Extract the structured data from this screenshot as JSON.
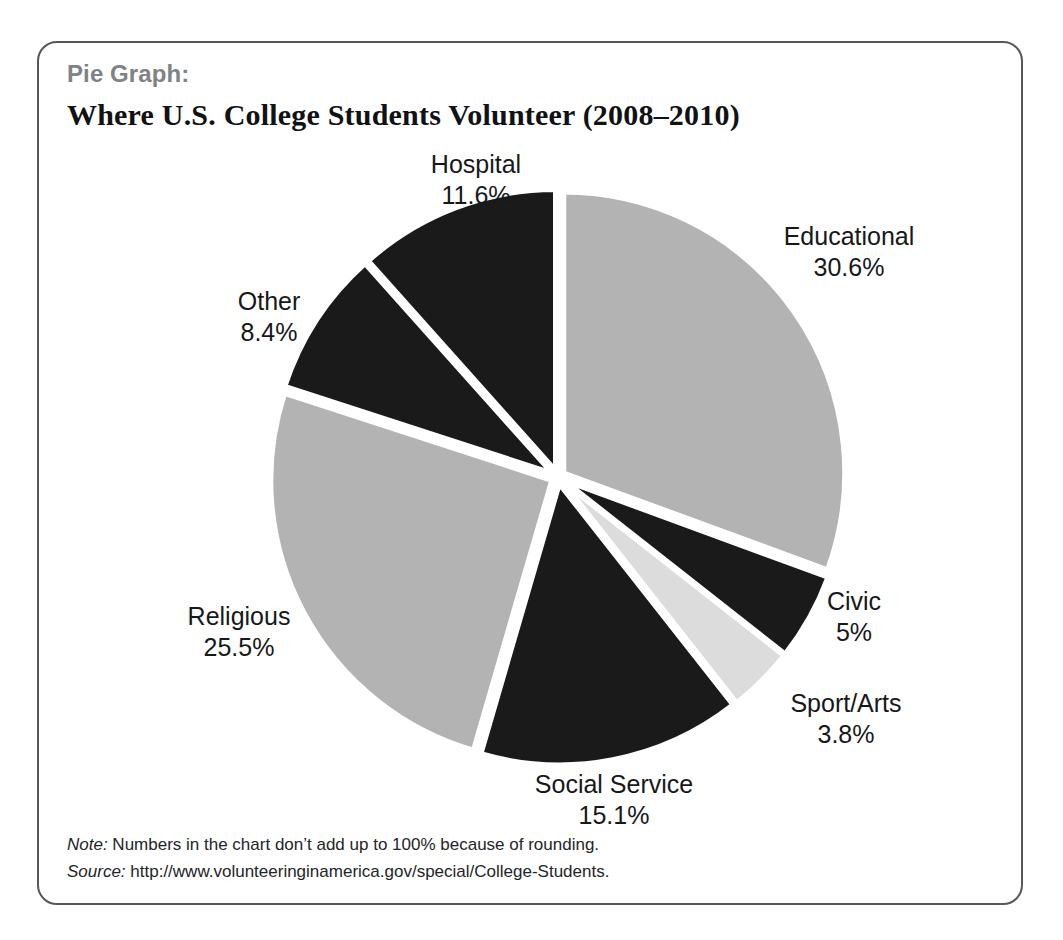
{
  "header": {
    "kicker": "Pie Graph:",
    "title": "Where U.S. College Students Volunteer (2008–2010)"
  },
  "footnotes": {
    "note_tag": "Note:",
    "note_text": " Numbers in the chart don’t add up to 100% because of rounding.",
    "source_tag": "Source:",
    "source_text": " http://www.volunteeringinamerica.gov/special/College-Students."
  },
  "labels": {
    "hospital": {
      "name": "Hospital",
      "value": "11.6%"
    },
    "educational": {
      "name": "Educational",
      "value": "30.6%"
    },
    "civic": {
      "name": "Civic",
      "value": "5%"
    },
    "sport_arts": {
      "name": "Sport/Arts",
      "value": "3.8%"
    },
    "social_service": {
      "name": "Social Service",
      "value": "15.1%"
    },
    "religious": {
      "name": "Religious",
      "value": "25.5%"
    },
    "other": {
      "name": "Other",
      "value": "8.4%"
    }
  },
  "colors": {
    "light_gray": "#b3b3b3",
    "pale_gray": "#dcdcdc",
    "near_black": "#1a1a1a",
    "gap_white": "#ffffff",
    "card_border": "#55585c",
    "kicker_gray": "#808286",
    "text_black": "#17181a"
  },
  "chart_data": {
    "type": "pie",
    "title": "Where U.S. College Students Volunteer (2008–2010)",
    "subtitle": "Pie Graph:",
    "unit": "percent",
    "start_angle_deg": 0,
    "direction": "clockwise",
    "exploded": true,
    "legend": "none (labels placed outside slices)",
    "categories": [
      "Educational",
      "Civic",
      "Sport/Arts",
      "Social Service",
      "Religious",
      "Other",
      "Hospital"
    ],
    "values": [
      30.6,
      5.0,
      3.8,
      15.1,
      25.5,
      8.4,
      11.6
    ],
    "slice_colors": [
      "#b3b3b3",
      "#1a1a1a",
      "#dcdcdc",
      "#1a1a1a",
      "#b3b3b3",
      "#1a1a1a",
      "#1a1a1a"
    ],
    "labels_formatted": [
      "30.6%",
      "5%",
      "3.8%",
      "15.1%",
      "25.5%",
      "8.4%",
      "11.6%"
    ],
    "total": 100.0,
    "note": "Numbers in the chart don’t add up to 100% because of rounding.",
    "source": "http://www.volunteeringinamerica.gov/special/College-Students."
  }
}
